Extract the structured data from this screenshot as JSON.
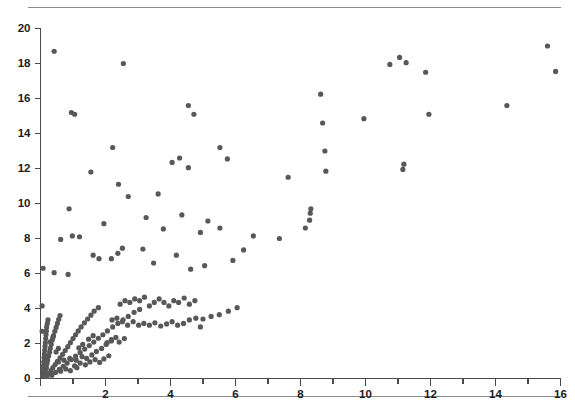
{
  "chart_data": {
    "type": "scatter",
    "title": "",
    "subtitle": "",
    "xlabel": "",
    "ylabel": "",
    "xlim": [
      0,
      16
    ],
    "ylim": [
      0,
      20
    ],
    "x_major_ticks": [
      0,
      2,
      4,
      6,
      8,
      10,
      12,
      14,
      16
    ],
    "x_tick_labels": [
      "0",
      "2",
      "4",
      "6",
      "8",
      "10",
      "12",
      "14",
      "16"
    ],
    "x_minor_tick_step": 1,
    "y_major_ticks": [
      0,
      2,
      4,
      6,
      8,
      10,
      12,
      14,
      16,
      18,
      20
    ],
    "y_tick_labels": [
      "0",
      "2",
      "4",
      "6",
      "8",
      "10",
      "12",
      "14",
      "16",
      "18",
      "20"
    ],
    "grid": false,
    "legend": null,
    "marker_color": "#585858",
    "marker_size_px": 5.2,
    "n_points": 203,
    "points": [
      [
        0.42,
        18.7
      ],
      [
        2.55,
        18.0
      ],
      [
        0.95,
        15.2
      ],
      [
        1.05,
        15.1
      ],
      [
        2.22,
        13.2
      ],
      [
        1.55,
        11.8
      ],
      [
        2.4,
        11.1
      ],
      [
        2.7,
        10.4
      ],
      [
        0.88,
        9.7
      ],
      [
        1.95,
        8.85
      ],
      [
        0.62,
        7.95
      ],
      [
        0.98,
        8.15
      ],
      [
        1.2,
        8.1
      ],
      [
        1.62,
        7.05
      ],
      [
        1.8,
        6.85
      ],
      [
        2.18,
        6.85
      ],
      [
        2.52,
        7.45
      ],
      [
        2.38,
        7.15
      ],
      [
        0.08,
        6.3
      ],
      [
        0.42,
        6.05
      ],
      [
        0.85,
        5.95
      ],
      [
        0.05,
        4.15
      ],
      [
        0.05,
        2.7
      ],
      [
        4.55,
        15.6
      ],
      [
        4.72,
        15.1
      ],
      [
        4.05,
        12.35
      ],
      [
        4.28,
        12.6
      ],
      [
        4.55,
        12.05
      ],
      [
        5.52,
        13.2
      ],
      [
        5.75,
        12.55
      ],
      [
        3.62,
        10.55
      ],
      [
        3.25,
        9.2
      ],
      [
        3.78,
        8.55
      ],
      [
        4.35,
        9.35
      ],
      [
        4.92,
        8.35
      ],
      [
        5.15,
        9.0
      ],
      [
        5.52,
        8.6
      ],
      [
        3.15,
        7.4
      ],
      [
        3.48,
        6.6
      ],
      [
        4.18,
        7.05
      ],
      [
        4.62,
        6.25
      ],
      [
        5.05,
        6.45
      ],
      [
        5.92,
        6.75
      ],
      [
        6.25,
        7.35
      ],
      [
        6.55,
        8.15
      ],
      [
        7.35,
        8.0
      ],
      [
        7.62,
        11.5
      ],
      [
        8.15,
        8.6
      ],
      [
        8.28,
        9.05
      ],
      [
        8.3,
        9.45
      ],
      [
        8.32,
        9.7
      ],
      [
        8.62,
        16.25
      ],
      [
        8.68,
        14.6
      ],
      [
        8.75,
        13.0
      ],
      [
        8.78,
        11.85
      ],
      [
        9.95,
        14.85
      ],
      [
        10.75,
        17.95
      ],
      [
        11.05,
        18.35
      ],
      [
        11.25,
        18.05
      ],
      [
        11.15,
        11.95
      ],
      [
        11.18,
        12.25
      ],
      [
        11.95,
        15.1
      ],
      [
        11.85,
        17.5
      ],
      [
        14.35,
        15.6
      ],
      [
        15.6,
        19.0
      ],
      [
        15.85,
        17.55
      ],
      [
        0.06,
        0.15
      ],
      [
        0.07,
        0.32
      ],
      [
        0.08,
        0.5
      ],
      [
        0.09,
        0.72
      ],
      [
        0.1,
        0.95
      ],
      [
        0.11,
        1.18
      ],
      [
        0.12,
        1.4
      ],
      [
        0.13,
        1.62
      ],
      [
        0.14,
        1.85
      ],
      [
        0.15,
        2.05
      ],
      [
        0.16,
        2.28
      ],
      [
        0.17,
        2.5
      ],
      [
        0.18,
        2.72
      ],
      [
        0.19,
        2.95
      ],
      [
        0.21,
        3.15
      ],
      [
        0.23,
        3.35
      ],
      [
        0.12,
        0.22
      ],
      [
        0.15,
        0.42
      ],
      [
        0.18,
        0.62
      ],
      [
        0.2,
        0.85
      ],
      [
        0.22,
        1.05
      ],
      [
        0.25,
        1.28
      ],
      [
        0.28,
        1.5
      ],
      [
        0.3,
        1.72
      ],
      [
        0.33,
        1.95
      ],
      [
        0.36,
        2.2
      ],
      [
        0.4,
        2.45
      ],
      [
        0.44,
        2.7
      ],
      [
        0.48,
        2.92
      ],
      [
        0.52,
        3.15
      ],
      [
        0.56,
        3.38
      ],
      [
        0.6,
        3.6
      ],
      [
        0.2,
        0.12
      ],
      [
        0.26,
        0.28
      ],
      [
        0.32,
        0.45
      ],
      [
        0.38,
        0.62
      ],
      [
        0.45,
        0.8
      ],
      [
        0.52,
        0.98
      ],
      [
        0.6,
        1.18
      ],
      [
        0.68,
        1.38
      ],
      [
        0.76,
        1.6
      ],
      [
        0.84,
        1.82
      ],
      [
        0.92,
        2.05
      ],
      [
        1.0,
        2.28
      ],
      [
        1.08,
        2.5
      ],
      [
        1.16,
        2.72
      ],
      [
        1.25,
        2.95
      ],
      [
        1.35,
        3.18
      ],
      [
        1.45,
        3.4
      ],
      [
        1.55,
        3.62
      ],
      [
        1.65,
        3.85
      ],
      [
        1.78,
        4.05
      ],
      [
        0.35,
        0.18
      ],
      [
        0.46,
        0.35
      ],
      [
        0.58,
        0.52
      ],
      [
        0.7,
        0.7
      ],
      [
        0.82,
        0.88
      ],
      [
        0.95,
        1.08
      ],
      [
        1.08,
        1.28
      ],
      [
        1.22,
        1.48
      ],
      [
        1.36,
        1.68
      ],
      [
        1.5,
        1.88
      ],
      [
        1.64,
        2.08
      ],
      [
        1.78,
        2.3
      ],
      [
        1.92,
        2.5
      ],
      [
        2.06,
        2.72
      ],
      [
        2.22,
        2.95
      ],
      [
        2.38,
        3.15
      ],
      [
        2.54,
        3.35
      ],
      [
        2.7,
        3.55
      ],
      [
        2.88,
        3.78
      ],
      [
        3.05,
        3.95
      ],
      [
        0.55,
        0.95
      ],
      [
        0.72,
        1.05
      ],
      [
        0.9,
        1.15
      ],
      [
        1.1,
        1.05
      ],
      [
        1.28,
        1.25
      ],
      [
        1.42,
        1.15
      ],
      [
        1.58,
        1.35
      ],
      [
        1.72,
        1.55
      ],
      [
        1.88,
        1.72
      ],
      [
        2.02,
        1.95
      ],
      [
        2.18,
        2.15
      ],
      [
        2.32,
        2.35
      ],
      [
        1.48,
        2.25
      ],
      [
        1.62,
        2.45
      ],
      [
        1.3,
        1.95
      ],
      [
        1.18,
        1.75
      ],
      [
        2.45,
        4.25
      ],
      [
        2.6,
        4.45
      ],
      [
        2.75,
        4.35
      ],
      [
        2.9,
        4.55
      ],
      [
        3.05,
        4.45
      ],
      [
        3.2,
        4.65
      ],
      [
        3.35,
        4.15
      ],
      [
        3.5,
        4.35
      ],
      [
        3.65,
        4.55
      ],
      [
        3.8,
        4.35
      ],
      [
        3.95,
        4.15
      ],
      [
        4.1,
        4.45
      ],
      [
        4.25,
        4.35
      ],
      [
        4.42,
        4.6
      ],
      [
        4.58,
        4.25
      ],
      [
        4.75,
        4.45
      ],
      [
        2.2,
        3.35
      ],
      [
        2.35,
        3.45
      ],
      [
        2.52,
        3.25
      ],
      [
        2.68,
        3.05
      ],
      [
        2.85,
        3.25
      ],
      [
        3.02,
        3.05
      ],
      [
        3.18,
        3.15
      ],
      [
        3.35,
        3.05
      ],
      [
        3.52,
        3.18
      ],
      [
        3.7,
        3.0
      ],
      [
        3.88,
        3.12
      ],
      [
        4.05,
        3.25
      ],
      [
        4.22,
        3.05
      ],
      [
        4.4,
        3.15
      ],
      [
        4.58,
        3.35
      ],
      [
        4.78,
        3.45
      ],
      [
        5.0,
        3.4
      ],
      [
        5.25,
        3.55
      ],
      [
        5.5,
        3.65
      ],
      [
        5.78,
        3.85
      ],
      [
        6.05,
        4.05
      ],
      [
        4.92,
        2.95
      ],
      [
        1.05,
        0.72
      ],
      [
        1.22,
        0.88
      ],
      [
        1.38,
        0.78
      ],
      [
        1.52,
        0.95
      ],
      [
        1.68,
        1.08
      ],
      [
        1.82,
        0.92
      ],
      [
        1.95,
        1.12
      ],
      [
        2.1,
        1.3
      ],
      [
        0.62,
        0.42
      ],
      [
        0.78,
        0.55
      ],
      [
        0.92,
        0.45
      ],
      [
        1.12,
        0.62
      ],
      [
        2.05,
        2.05
      ],
      [
        2.18,
        2.22
      ],
      [
        0.3,
        2.1
      ],
      [
        0.38,
        2.35
      ],
      [
        2.42,
        2.08
      ],
      [
        2.58,
        2.28
      ],
      [
        0.48,
        1.52
      ],
      [
        0.55,
        1.72
      ]
    ]
  }
}
